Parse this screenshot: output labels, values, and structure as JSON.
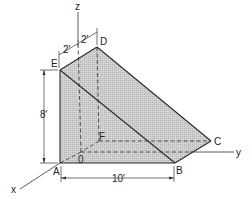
{
  "diagram": {
    "type": "isometric-wedge",
    "colors": {
      "fill": "#c8c8c8",
      "edge": "#2a2a2a",
      "dash": "#444444",
      "background": "#ffffff"
    },
    "axes": {
      "x": "x",
      "y": "y",
      "z": "z"
    },
    "points": {
      "A": "A",
      "B": "B",
      "C": "C",
      "D": "D",
      "E": "E",
      "F": "F",
      "O": "0"
    },
    "dimensions": {
      "height": "8'",
      "length": "10'",
      "offset_left": "2'",
      "offset_right": "2'"
    }
  }
}
